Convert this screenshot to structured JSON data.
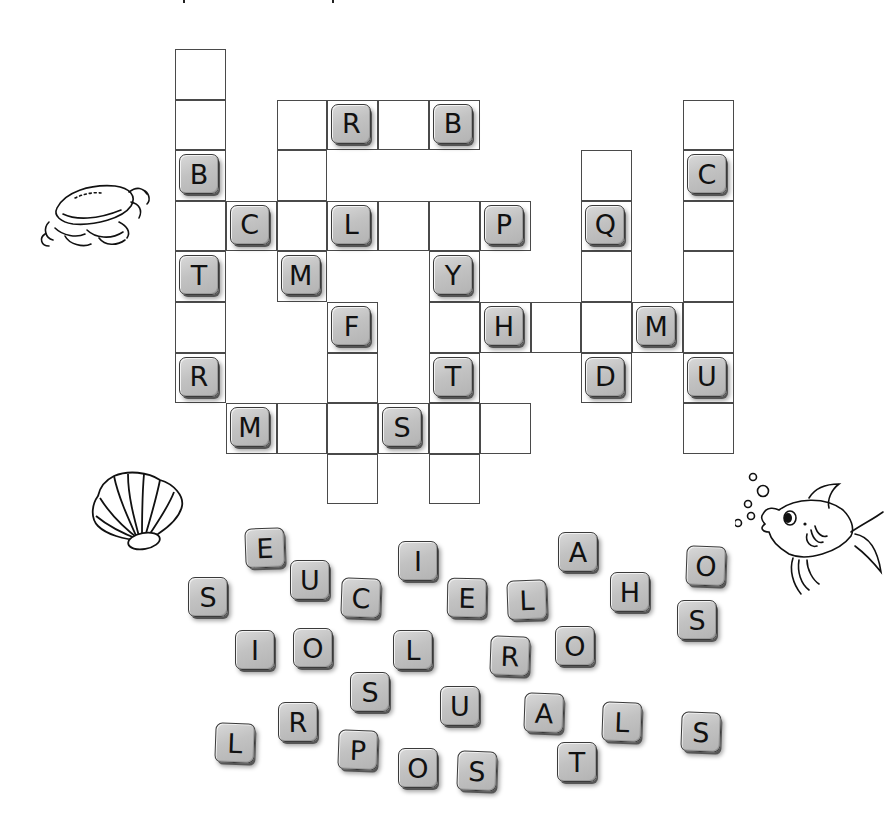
{
  "puzzle": {
    "grid": {
      "origin_x": 175,
      "origin_y": 49,
      "cell_w": 50.8,
      "cell_h": 50.6,
      "cells": [
        {
          "row": 0,
          "col": 0,
          "letter": ""
        },
        {
          "row": 1,
          "col": 0,
          "letter": ""
        },
        {
          "row": 2,
          "col": 0,
          "letter": "B"
        },
        {
          "row": 3,
          "col": 0,
          "letter": ""
        },
        {
          "row": 4,
          "col": 0,
          "letter": "T"
        },
        {
          "row": 5,
          "col": 0,
          "letter": ""
        },
        {
          "row": 6,
          "col": 0,
          "letter": "R"
        },
        {
          "row": 3,
          "col": 1,
          "letter": "C"
        },
        {
          "row": 7,
          "col": 1,
          "letter": "M"
        },
        {
          "row": 1,
          "col": 2,
          "letter": ""
        },
        {
          "row": 2,
          "col": 2,
          "letter": ""
        },
        {
          "row": 3,
          "col": 2,
          "letter": ""
        },
        {
          "row": 4,
          "col": 2,
          "letter": "M"
        },
        {
          "row": 7,
          "col": 2,
          "letter": ""
        },
        {
          "row": 1,
          "col": 3,
          "letter": "R"
        },
        {
          "row": 3,
          "col": 3,
          "letter": "L"
        },
        {
          "row": 5,
          "col": 3,
          "letter": "F"
        },
        {
          "row": 6,
          "col": 3,
          "letter": ""
        },
        {
          "row": 7,
          "col": 3,
          "letter": ""
        },
        {
          "row": 8,
          "col": 3,
          "letter": ""
        },
        {
          "row": 1,
          "col": 4,
          "letter": ""
        },
        {
          "row": 3,
          "col": 4,
          "letter": ""
        },
        {
          "row": 7,
          "col": 4,
          "letter": "S"
        },
        {
          "row": 1,
          "col": 5,
          "letter": "B"
        },
        {
          "row": 3,
          "col": 5,
          "letter": ""
        },
        {
          "row": 4,
          "col": 5,
          "letter": "Y"
        },
        {
          "row": 5,
          "col": 5,
          "letter": ""
        },
        {
          "row": 6,
          "col": 5,
          "letter": "T"
        },
        {
          "row": 7,
          "col": 5,
          "letter": ""
        },
        {
          "row": 8,
          "col": 5,
          "letter": ""
        },
        {
          "row": 3,
          "col": 6,
          "letter": "P"
        },
        {
          "row": 5,
          "col": 6,
          "letter": "H"
        },
        {
          "row": 7,
          "col": 6,
          "letter": ""
        },
        {
          "row": 5,
          "col": 7,
          "letter": ""
        },
        {
          "row": 2,
          "col": 8,
          "letter": ""
        },
        {
          "row": 3,
          "col": 8,
          "letter": "Q"
        },
        {
          "row": 4,
          "col": 8,
          "letter": ""
        },
        {
          "row": 5,
          "col": 8,
          "letter": ""
        },
        {
          "row": 6,
          "col": 8,
          "letter": "D"
        },
        {
          "row": 5,
          "col": 9,
          "letter": "M"
        },
        {
          "row": 1,
          "col": 10,
          "letter": ""
        },
        {
          "row": 2,
          "col": 10,
          "letter": "C"
        },
        {
          "row": 3,
          "col": 10,
          "letter": ""
        },
        {
          "row": 4,
          "col": 10,
          "letter": ""
        },
        {
          "row": 5,
          "col": 10,
          "letter": ""
        },
        {
          "row": 6,
          "col": 10,
          "letter": "U"
        },
        {
          "row": 7,
          "col": 10,
          "letter": ""
        }
      ]
    },
    "letter_bank": [
      {
        "letter": "E",
        "x": 265,
        "y": 548,
        "rot": -2
      },
      {
        "letter": "S",
        "x": 208,
        "y": 597,
        "rot": 0
      },
      {
        "letter": "U",
        "x": 310,
        "y": 580,
        "rot": 0
      },
      {
        "letter": "C",
        "x": 361,
        "y": 598,
        "rot": 2
      },
      {
        "letter": "I",
        "x": 418,
        "y": 561,
        "rot": 0
      },
      {
        "letter": "E",
        "x": 467,
        "y": 598,
        "rot": 1
      },
      {
        "letter": "L",
        "x": 527,
        "y": 600,
        "rot": -2
      },
      {
        "letter": "A",
        "x": 578,
        "y": 552,
        "rot": 0
      },
      {
        "letter": "H",
        "x": 630,
        "y": 592,
        "rot": 0
      },
      {
        "letter": "O",
        "x": 706,
        "y": 566,
        "rot": 2
      },
      {
        "letter": "S",
        "x": 697,
        "y": 620,
        "rot": 0
      },
      {
        "letter": "I",
        "x": 255,
        "y": 650,
        "rot": 0
      },
      {
        "letter": "O",
        "x": 313,
        "y": 648,
        "rot": 0
      },
      {
        "letter": "L",
        "x": 413,
        "y": 650,
        "rot": 0
      },
      {
        "letter": "R",
        "x": 510,
        "y": 656,
        "rot": 2
      },
      {
        "letter": "O",
        "x": 575,
        "y": 646,
        "rot": 0
      },
      {
        "letter": "S",
        "x": 370,
        "y": 692,
        "rot": 0
      },
      {
        "letter": "R",
        "x": 298,
        "y": 722,
        "rot": 0
      },
      {
        "letter": "L",
        "x": 235,
        "y": 743,
        "rot": 2
      },
      {
        "letter": "P",
        "x": 358,
        "y": 750,
        "rot": 2
      },
      {
        "letter": "U",
        "x": 460,
        "y": 706,
        "rot": 0
      },
      {
        "letter": "O",
        "x": 418,
        "y": 768,
        "rot": 0
      },
      {
        "letter": "S",
        "x": 477,
        "y": 771,
        "rot": 2
      },
      {
        "letter": "A",
        "x": 544,
        "y": 713,
        "rot": 2
      },
      {
        "letter": "T",
        "x": 577,
        "y": 762,
        "rot": 0
      },
      {
        "letter": "L",
        "x": 622,
        "y": 722,
        "rot": 2
      },
      {
        "letter": "S",
        "x": 701,
        "y": 732,
        "rot": 2
      }
    ]
  },
  "decorations": [
    {
      "name": "crab-illustration",
      "x": 35,
      "y": 178
    },
    {
      "name": "seashell-illustration",
      "x": 88,
      "y": 468
    },
    {
      "name": "fish-illustration",
      "x": 735,
      "y": 462
    }
  ]
}
